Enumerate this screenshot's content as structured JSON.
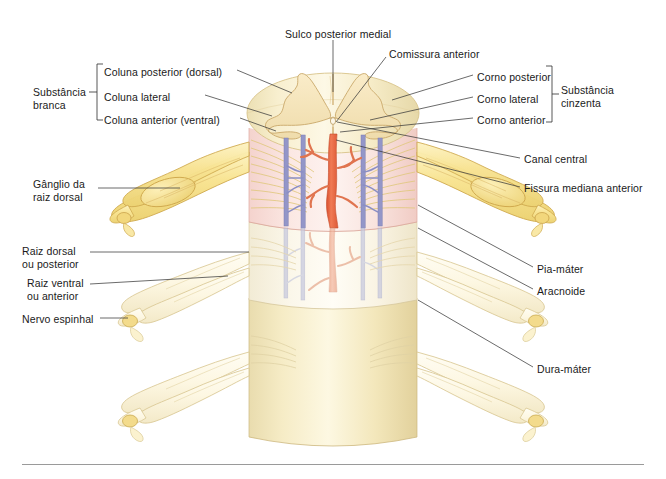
{
  "figure": {
    "background_color": "#ffffff",
    "width": 666,
    "height": 479
  },
  "palette": {
    "white_matter": "#fcf3d4",
    "white_matter_shade": "#f0e3b6",
    "gray_matter": "#f5e3bc",
    "gray_matter_edge": "#c9a86a",
    "nerve": "#f7e08a",
    "nerve_light": "#fdf6dc",
    "nerve_edge": "#cfa94e",
    "pia": "#f9dcd8",
    "pia_edge": "#e0a59c",
    "arachnoid": "#fbf6ea",
    "dura": "#f4e7bd",
    "artery": "#e8603c",
    "artery_light": "#eda184",
    "vein": "#8b8ec4",
    "vein_light": "#b9bcd8",
    "leader_line": "#3a3a3a",
    "bracket": "#3a3a3a",
    "rule": "#9a9a9a",
    "text": "#1a1a1a"
  },
  "brackets": {
    "white_matter_group": "Substância\nbranca",
    "gray_matter_group": "Substância\ncinzenta"
  },
  "labels": [
    {
      "id": "sulco-posterior-medial",
      "text": "Sulco posterior medial",
      "x": 285,
      "y": 28,
      "align": "left"
    },
    {
      "id": "comissura-anterior",
      "text": "Comissura anterior",
      "x": 389,
      "y": 48,
      "align": "left"
    },
    {
      "id": "coluna-posterior",
      "text": "Coluna posterior (dorsal)",
      "x": 104,
      "y": 66,
      "align": "left"
    },
    {
      "id": "corno-posterior",
      "text": "Corno posterior",
      "x": 477,
      "y": 71,
      "align": "left"
    },
    {
      "id": "substancia-branca",
      "text": "Substância\nbranca",
      "x": 33,
      "y": 86,
      "align": "left"
    },
    {
      "id": "coluna-lateral",
      "text": "Coluna lateral",
      "x": 104,
      "y": 91,
      "align": "left"
    },
    {
      "id": "corno-lateral",
      "text": "Corno lateral",
      "x": 477,
      "y": 93,
      "align": "left"
    },
    {
      "id": "substancia-cinzenta",
      "text": "Substância\ncinzenta",
      "x": 561,
      "y": 84,
      "align": "left"
    },
    {
      "id": "coluna-anterior",
      "text": "Coluna anterior (ventral)",
      "x": 104,
      "y": 114,
      "align": "left"
    },
    {
      "id": "corno-anterior",
      "text": "Corno anterior",
      "x": 477,
      "y": 114,
      "align": "left"
    },
    {
      "id": "canal-central",
      "text": "Canal central",
      "x": 524,
      "y": 153,
      "align": "left"
    },
    {
      "id": "ganglio-raiz-dorsal",
      "text": "Gânglio da\nraiz dorsal",
      "x": 33,
      "y": 178,
      "align": "left"
    },
    {
      "id": "fissura-mediana-anterior",
      "text": "Fissura mediana anterior",
      "x": 524,
      "y": 182,
      "align": "left"
    },
    {
      "id": "raiz-dorsal",
      "text": "Raiz dorsal\nou posterior",
      "x": 22,
      "y": 245,
      "align": "left"
    },
    {
      "id": "pia-mater",
      "text": "Pia-máter",
      "x": 537,
      "y": 263,
      "align": "left"
    },
    {
      "id": "raiz-ventral",
      "text": "Raiz ventral\nou anterior",
      "x": 27,
      "y": 277,
      "align": "left"
    },
    {
      "id": "aracnoide",
      "text": "Aracnoide",
      "x": 537,
      "y": 285,
      "align": "left"
    },
    {
      "id": "nervo-espinhal",
      "text": "Nervo espinhal",
      "x": 22,
      "y": 313,
      "align": "left"
    },
    {
      "id": "dura-mater",
      "text": "Dura-máter",
      "x": 537,
      "y": 363,
      "align": "left"
    }
  ],
  "anatomy": {
    "segments": [
      {
        "name": "pia-mater-segment",
        "label": "Pia-máter"
      },
      {
        "name": "arachnoid-segment",
        "label": "Aracnoide"
      },
      {
        "name": "dura-mater-segment",
        "label": "Dura-máter"
      }
    ],
    "vessels": [
      {
        "name": "anterior-spinal-artery",
        "color": "#e8603c"
      },
      {
        "name": "spinal-veins",
        "color": "#8b8ec4"
      }
    ]
  }
}
